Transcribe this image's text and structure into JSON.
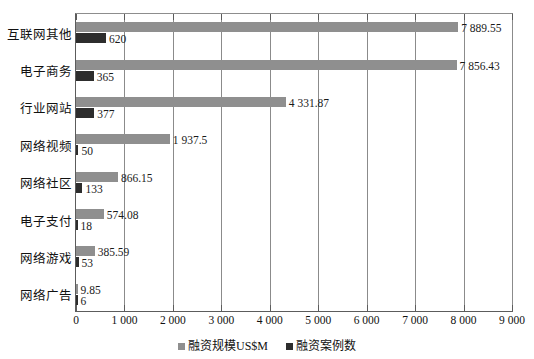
{
  "chart_data": {
    "type": "bar",
    "orientation": "horizontal",
    "title": "",
    "xlabel": "",
    "ylabel": "",
    "xlim": [
      0,
      9000
    ],
    "xticks": [
      "0",
      "1 000",
      "2 000",
      "3 000",
      "4 000",
      "5 000",
      "6 000",
      "7 000",
      "8 000",
      "9 000"
    ],
    "xtick_values": [
      0,
      1000,
      2000,
      3000,
      4000,
      5000,
      6000,
      7000,
      8000,
      9000
    ],
    "grid": true,
    "grid_axis": "x",
    "legend_position": "bottom-center",
    "categories": [
      "互联网其他",
      "电子商务",
      "行业网站",
      "网络视频",
      "网络社区",
      "电子支付",
      "网络游戏",
      "网络广告"
    ],
    "series": [
      {
        "name": "融资规模US$M",
        "color": "#8f8f8f",
        "values": [
          7889.55,
          7856.43,
          4331.87,
          1937.5,
          866.15,
          574.08,
          385.59,
          9.85
        ],
        "labels": [
          "7 889.55",
          "7 856.43",
          "4 331.87",
          "1 937.5",
          "866.15",
          "574.08",
          "385.59",
          "9.85"
        ]
      },
      {
        "name": "融资案例数",
        "color": "#2d2d2d",
        "values": [
          620,
          365,
          377,
          50,
          133,
          18,
          53,
          6
        ],
        "labels": [
          "620",
          "365",
          "377",
          "50",
          "133",
          "18",
          "53",
          "6"
        ]
      }
    ]
  },
  "legend": {
    "items": [
      {
        "label": "融资规模US$M"
      },
      {
        "label": "融资案例数"
      }
    ]
  }
}
